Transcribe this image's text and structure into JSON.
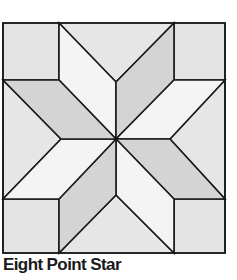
{
  "diagram": {
    "type": "quilt-block",
    "title": "Eight Point Star",
    "colors": {
      "background": "#ffffff",
      "stroke": "#1a1a1a",
      "corner": "#e3e3e3",
      "triangle": "#e6e6e6",
      "light_diamond": "#f4f4f4",
      "dark_diamond": "#d4d4d4"
    }
  },
  "caption": "Eight Point Star"
}
